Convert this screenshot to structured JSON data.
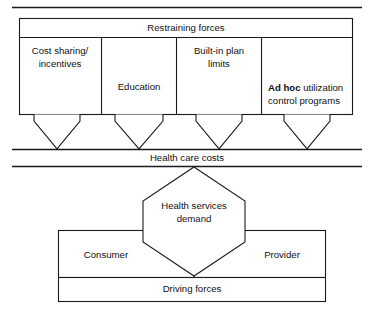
{
  "figure": {
    "title_band": "Restraining forces",
    "middle_band": "Health care costs",
    "bottom_band": "Driving forces",
    "center_node": {
      "line1": "Health services",
      "line2": "demand"
    },
    "restraining_columns": [
      {
        "id": "cost-sharing",
        "line1": "Cost sharing/",
        "line2": "incentives",
        "bold_prefix": ""
      },
      {
        "id": "education",
        "line1": "Education",
        "line2": "",
        "bold_prefix": ""
      },
      {
        "id": "built-in-plan-limits",
        "line1": "Built-in plan",
        "line2": "limits",
        "bold_prefix": ""
      },
      {
        "id": "ad-hoc-utilization",
        "line1": "utilization",
        "line2": "control programs",
        "bold_prefix": "Ad hoc"
      }
    ],
    "driving_actors": [
      {
        "id": "consumer",
        "label": "Consumer"
      },
      {
        "id": "provider",
        "label": "Provider"
      }
    ]
  },
  "colors": {
    "ink": "#1a1a1a",
    "paper": "#ffffff",
    "text": "#111111"
  }
}
